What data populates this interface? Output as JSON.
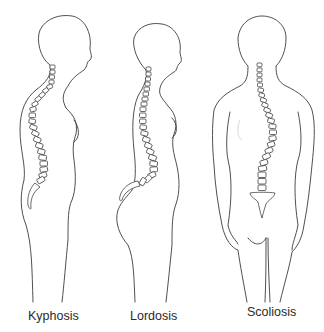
{
  "diagram": {
    "stroke_color": "#3c3c3c",
    "background": "#ffffff",
    "figures": [
      {
        "id": "kyphosis",
        "label": "Kyphosis",
        "view": "side profile",
        "curve": "excessive outward upper-back curve"
      },
      {
        "id": "lordosis",
        "label": "Lordosis",
        "view": "side profile",
        "curve": "excessive inward lower-back curve"
      },
      {
        "id": "scoliosis",
        "label": "Scoliosis",
        "view": "back",
        "curve": "sideways S-shaped curve"
      }
    ]
  }
}
